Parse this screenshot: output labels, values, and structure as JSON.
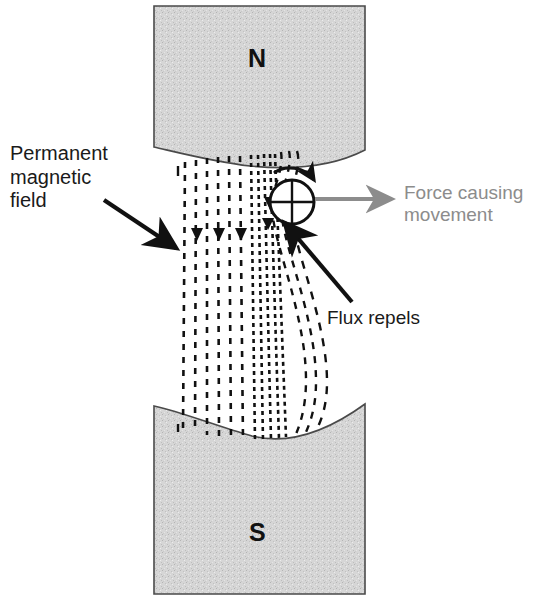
{
  "diagram": {
    "canvas": {
      "width": 541,
      "height": 603,
      "background": "#ffffff"
    },
    "poles": {
      "north": {
        "letter": "N",
        "name": "north-pole-magnet",
        "fill": "#d2d2d2",
        "stroke": "#4a4a4a",
        "rect": {
          "x": 154,
          "y": 6,
          "width": 211,
          "height": 160
        },
        "face": "concave-bottom"
      },
      "south": {
        "letter": "S",
        "name": "south-pole-magnet",
        "fill": "#d2d2d2",
        "stroke": "#4a4a4a",
        "rect": {
          "x": 154,
          "y": 404,
          "width": 211,
          "height": 190
        },
        "face": "concave-top"
      }
    },
    "flux": {
      "name": "magnetic-flux-lines",
      "style": "dashed",
      "color": "#111111",
      "direction": "north-to-south",
      "line_count": 13,
      "arrowheads": 5,
      "distortion": "lines bunch and bend around the conductor on the right"
    },
    "conductor": {
      "name": "conductor-cross-section",
      "symbol": "circle-with-cross",
      "meaning": "current into page",
      "center": {
        "x": 292,
        "y": 202
      },
      "radius": 22,
      "stroke": "#111111"
    },
    "rotation_arrow": {
      "name": "rotation-arrow",
      "direction": "clockwise",
      "color": "#111111"
    },
    "labels": {
      "permanent_field": "Permanent\nmagnetic\nfield",
      "force": "Force causing\nmovement",
      "flux_repels": "Flux repels"
    },
    "arrows": [
      {
        "name": "permanent-field-pointer-arrow",
        "label": "Permanent magnetic field",
        "color": "#111111",
        "from": {
          "x": 104,
          "y": 200
        },
        "to": {
          "x": 180,
          "y": 251
        }
      },
      {
        "name": "force-arrow",
        "label": "Force causing movement",
        "color": "#8c8c8c",
        "from": {
          "x": 314,
          "y": 199
        },
        "to": {
          "x": 396,
          "y": 199
        }
      },
      {
        "name": "flux-repels-pointer-arrow",
        "label": "Flux repels",
        "color": "#111111",
        "from": {
          "x": 352,
          "y": 302
        },
        "to": {
          "x": 281,
          "y": 219
        }
      }
    ],
    "colors": {
      "magnet_fill": "#d2d2d2",
      "magnet_stroke": "#4a4a4a",
      "ink": "#111111",
      "gray_accent": "#8c8c8c",
      "background": "#ffffff"
    }
  }
}
